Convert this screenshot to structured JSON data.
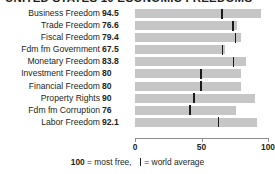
{
  "title": "UNITED STATES 10 ECONOMIC FREEDOMS",
  "axis": {
    "ticks": [
      {
        "label": "0",
        "value": 0
      },
      {
        "label": "50",
        "value": 50
      },
      {
        "label": "100",
        "value": 100
      }
    ],
    "min": 0,
    "max": 100
  },
  "legend": {
    "max_value": "100",
    "max_text": "= most free,",
    "avg_text": "= world average"
  },
  "colors": {
    "bar": "#c6c6c6",
    "average_marker": "#1a1a1a",
    "text": "#231f20",
    "axis": "#8c8c8c"
  },
  "chart_data": {
    "type": "bar",
    "title": "UNITED STATES 10 ECONOMIC FREEDOMS",
    "xlabel": "",
    "ylabel": "",
    "xlim": [
      0,
      100
    ],
    "grid": false,
    "legend_position": "bottom",
    "orientation": "horizontal",
    "categories": [
      "Business Freedom",
      "Trade Freedom",
      "Fiscal Freedom",
      "Fdm fm Government",
      "Monetary Freedom",
      "Investment Freedom",
      "Financial Freedom",
      "Property Rights",
      "Fdm fm Corruption",
      "Labor Freedom"
    ],
    "values": [
      94.5,
      76.6,
      79.4,
      67.5,
      83.8,
      80,
      80,
      90,
      76,
      92.1
    ],
    "value_labels": [
      "94.5",
      "76.6",
      "79.4",
      "67.5",
      "83.8",
      "80",
      "80",
      "90",
      "76",
      "92.1"
    ],
    "world_average": [
      64.6,
      73.1,
      74.9,
      65.1,
      73.4,
      48.8,
      48.9,
      43.8,
      40.5,
      62.1
    ],
    "series": [
      {
        "name": "United States",
        "values": [
          94.5,
          76.6,
          79.4,
          67.5,
          83.8,
          80,
          80,
          90,
          76,
          92.1
        ]
      },
      {
        "name": "world average",
        "values": [
          64.6,
          73.1,
          74.9,
          65.1,
          73.4,
          48.8,
          48.9,
          43.8,
          40.5,
          62.1
        ]
      }
    ]
  }
}
